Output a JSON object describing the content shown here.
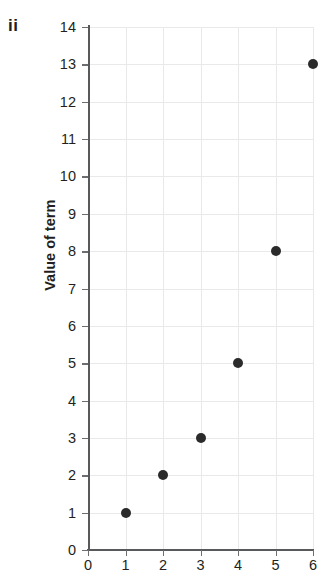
{
  "part_label": "ii",
  "chart_data": {
    "type": "scatter",
    "title": "",
    "xlabel": "",
    "ylabel": "Value of term",
    "x": [
      1,
      2,
      3,
      4,
      5,
      6
    ],
    "values": [
      1,
      2,
      3,
      5,
      8,
      13
    ],
    "points": [
      {
        "x": 1,
        "y": 1
      },
      {
        "x": 2,
        "y": 2
      },
      {
        "x": 3,
        "y": 3
      },
      {
        "x": 4,
        "y": 5
      },
      {
        "x": 5,
        "y": 8
      },
      {
        "x": 6,
        "y": 13
      }
    ],
    "xlim": [
      0,
      6
    ],
    "ylim": [
      0,
      14
    ],
    "xticks": [
      0,
      1,
      2,
      3,
      4,
      5,
      6
    ],
    "yticks": [
      0,
      1,
      2,
      3,
      4,
      5,
      6,
      7,
      8,
      9,
      10,
      11,
      12,
      13,
      14
    ],
    "xtick_labels": [
      "0",
      "1",
      "2",
      "3",
      "4",
      "5",
      "6"
    ],
    "ytick_labels": [
      "0",
      "1",
      "2",
      "3",
      "4",
      "5",
      "6",
      "7",
      "8",
      "9",
      "10",
      "11",
      "12",
      "13",
      "14"
    ],
    "grid": true,
    "legend": false,
    "marker_color": "#2b2b2b",
    "grid_color": "#e9e9e9",
    "axis_color": "#58595b"
  }
}
